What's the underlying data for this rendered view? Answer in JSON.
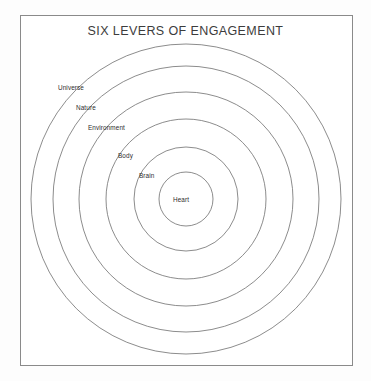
{
  "title": "SIX LEVERS OF ENGAGEMENT",
  "colors": {
    "frame_stroke": "#8a8a8a",
    "ring_stroke": "#6f6f6f",
    "background": "#ffffff",
    "canvas_background": "#fdfdfd",
    "title_text": "#3c3c3c",
    "label_text": "#2e2e2e"
  },
  "chart_data": {
    "type": "diagram",
    "subtype": "concentric-circles",
    "title": "SIX LEVERS OF ENGAGEMENT",
    "center": {
      "x": 186,
      "y": 199
    },
    "order": "outermost-to-innermost",
    "rings": [
      {
        "label": "Universe",
        "level": 1,
        "radius": 155,
        "label_x": 58,
        "label_y": 84
      },
      {
        "label": "Nature",
        "level": 2,
        "radius": 133,
        "label_x": 76,
        "label_y": 104
      },
      {
        "label": "Environment",
        "level": 3,
        "radius": 107,
        "label_x": 88,
        "label_y": 124
      },
      {
        "label": "Body",
        "level": 4,
        "radius": 80,
        "label_x": 118,
        "label_y": 152
      },
      {
        "label": "Brain",
        "level": 5,
        "radius": 52,
        "label_x": 139,
        "label_y": 172
      },
      {
        "label": "Heart",
        "level": 6,
        "radius": 27,
        "label_x": 173,
        "label_y": 196
      }
    ],
    "legend": null,
    "grid": false
  }
}
